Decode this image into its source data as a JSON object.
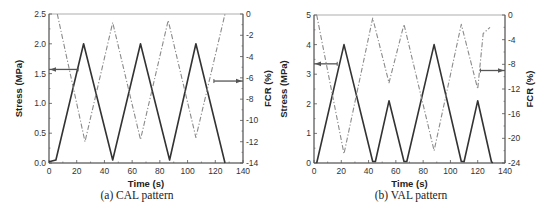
{
  "chart_data": [
    {
      "type": "line",
      "panel_id": "a",
      "caption": "(a) CAL pattern",
      "xlabel": "Time (s)",
      "ylabel": "Stress (MPa)",
      "y2label": "FCR (%)",
      "xlim": [
        0,
        140
      ],
      "ylim": [
        0,
        2.5
      ],
      "y2lim": [
        -14,
        0
      ],
      "x_ticks": [
        0,
        20,
        40,
        60,
        80,
        100,
        120,
        140
      ],
      "y_ticks": [
        0.0,
        0.5,
        1.0,
        1.5,
        2.0,
        2.5
      ],
      "y_tick_labels": [
        "0.0",
        "0.5",
        "1.0",
        "1.5",
        "2.0",
        "2.5"
      ],
      "y2_ticks": [
        0,
        -2,
        -4,
        -6,
        -8,
        -10,
        -12,
        -14
      ],
      "grid": false,
      "legend": "arrows: left arrow points to Stress axis, right arrow points to FCR axis",
      "series": [
        {
          "name": "Stress",
          "axis": "left",
          "style": "solid",
          "color": "#333333",
          "x": [
            0,
            5,
            25,
            46,
            66,
            87,
            106,
            127
          ],
          "y": [
            0.02,
            0.05,
            2.0,
            0.05,
            2.0,
            0.05,
            2.0,
            0.0
          ]
        },
        {
          "name": "FCR",
          "axis": "right",
          "style": "dash-dot",
          "color": "#888888",
          "x": [
            6,
            26,
            46,
            66,
            86,
            106,
            127
          ],
          "y": [
            0,
            -12.0,
            -0.8,
            -11.8,
            -0.6,
            -11.6,
            0
          ]
        }
      ],
      "annotations": [
        {
          "type": "arrow",
          "direction": "left",
          "from_x": 21,
          "to_x": 0,
          "y_left": 1.57,
          "target": "Stress axis"
        },
        {
          "type": "arrow",
          "direction": "right",
          "from_x": 119,
          "to_x": 140,
          "y_right": -6.3,
          "target": "FCR axis"
        }
      ]
    },
    {
      "type": "line",
      "panel_id": "b",
      "caption": "(b) VAL pattern",
      "xlabel": "Time (s)",
      "ylabel": "Stress (MPa)",
      "y2label": "FCR (%)",
      "xlim": [
        0,
        140
      ],
      "ylim": [
        0,
        5
      ],
      "y2lim": [
        -24,
        0
      ],
      "x_ticks": [
        0,
        20,
        40,
        60,
        80,
        100,
        120,
        140
      ],
      "y_ticks": [
        0,
        1,
        2,
        3,
        4,
        5
      ],
      "y_tick_labels": [
        "0",
        "1",
        "2",
        "3",
        "4",
        "5"
      ],
      "y2_ticks": [
        0,
        -4,
        -8,
        -12,
        -16,
        -20,
        -24
      ],
      "grid": false,
      "legend": "arrows: left arrow points to Stress axis, right arrow points to FCR axis",
      "series": [
        {
          "name": "Stress",
          "axis": "left",
          "style": "solid",
          "color": "#333333",
          "x": [
            2,
            22,
            43,
            45,
            55,
            66,
            68,
            88,
            108,
            110,
            120,
            130,
            131
          ],
          "y": [
            0,
            4.0,
            0.05,
            0.05,
            2.1,
            0.05,
            0.05,
            4.0,
            0.05,
            0.05,
            2.1,
            0.05,
            0
          ]
        },
        {
          "name": "FCR",
          "axis": "right",
          "style": "dash-dot",
          "color": "#888888",
          "x": [
            2,
            22,
            43,
            55,
            66,
            88,
            108,
            120,
            124,
            129
          ],
          "y": [
            0,
            -22.5,
            -0.5,
            -11.0,
            -1.5,
            -22.0,
            -1.5,
            -12.0,
            -3.0,
            -2.0
          ]
        }
      ],
      "annotations": [
        {
          "type": "arrow",
          "direction": "left",
          "from_x": 17,
          "to_x": 0,
          "y_left": 3.35,
          "target": "Stress axis"
        },
        {
          "type": "arrow",
          "direction": "right",
          "from_x": 122,
          "to_x": 140,
          "y_right": -9.0,
          "target": "FCR axis"
        }
      ]
    }
  ],
  "captions": {
    "a": "(a) CAL pattern",
    "b": "(b) VAL pattern"
  },
  "colors": {
    "stress_line": "#333333",
    "fcr_line": "#8a8a8a",
    "axis": "#555555",
    "arrow": "#555555"
  }
}
